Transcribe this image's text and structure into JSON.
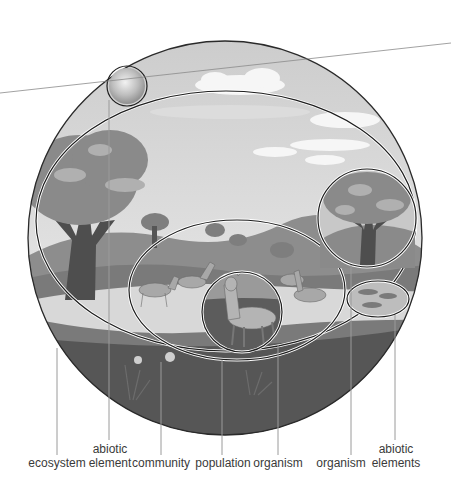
{
  "diagram": {
    "colors": {
      "sky": "#d2d2d2",
      "cloud": "#f4f4f4",
      "foliage": "#8c8c8c",
      "foliage_light": "#aaaaaa",
      "trunk": "#4e4e4e",
      "hills": "#8a8a8a",
      "water": "#e6e6e6",
      "ground": "#555555",
      "outline": "#1e1e1e",
      "leader": "#9a9a9a",
      "label": "#3a3a3a"
    },
    "labels": [
      {
        "id": "ecosystem",
        "text": "ecosystem"
      },
      {
        "id": "abiotic-element",
        "line1": "abiotic",
        "line2": "element"
      },
      {
        "id": "community",
        "text": "community"
      },
      {
        "id": "population",
        "text": "population"
      },
      {
        "id": "organism-deer",
        "text": "organism"
      },
      {
        "id": "organism-tree",
        "text": "organism"
      },
      {
        "id": "abiotic-elements",
        "line1": "abiotic",
        "line2": "elements"
      }
    ]
  }
}
